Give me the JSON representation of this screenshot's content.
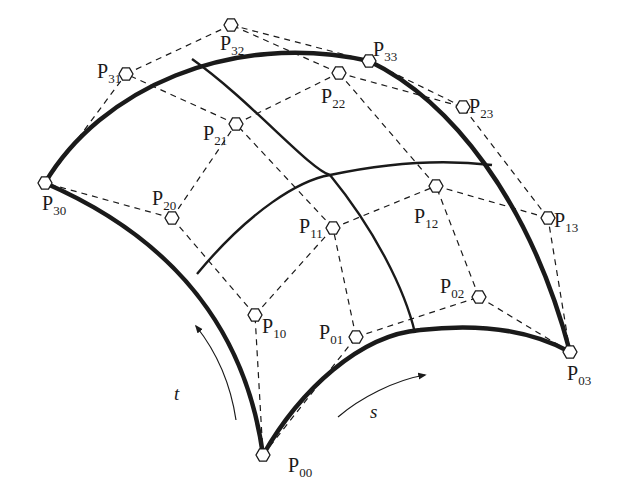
{
  "figure": {
    "colors": {
      "stroke": "#1a1a1a",
      "background": "#ffffff"
    },
    "control_points": [
      {
        "id": "P00",
        "letter": "P",
        "sub": "00",
        "x": 263,
        "y": 455,
        "lx": 288,
        "ly": 472,
        "anchor": "start"
      },
      {
        "id": "P01",
        "letter": "P",
        "sub": "01",
        "x": 356,
        "y": 337,
        "lx": 319,
        "ly": 339,
        "anchor": "start"
      },
      {
        "id": "P02",
        "letter": "P",
        "sub": "02",
        "x": 479,
        "y": 297,
        "lx": 440,
        "ly": 293,
        "anchor": "start"
      },
      {
        "id": "P03",
        "letter": "P",
        "sub": "03",
        "x": 570,
        "y": 352,
        "lx": 567,
        "ly": 380,
        "anchor": "start"
      },
      {
        "id": "P10",
        "letter": "P",
        "sub": "10",
        "x": 255,
        "y": 315,
        "lx": 262,
        "ly": 333,
        "anchor": "start"
      },
      {
        "id": "P11",
        "letter": "P",
        "sub": "11",
        "x": 333,
        "y": 228,
        "lx": 299,
        "ly": 233,
        "anchor": "start"
      },
      {
        "id": "P12",
        "letter": "P",
        "sub": "12",
        "x": 436,
        "y": 186,
        "lx": 414,
        "ly": 223,
        "anchor": "start"
      },
      {
        "id": "P13",
        "letter": "P",
        "sub": "13",
        "x": 548,
        "y": 218,
        "lx": 554,
        "ly": 227,
        "anchor": "start"
      },
      {
        "id": "P20",
        "letter": "P",
        "sub": "20",
        "x": 172,
        "y": 218,
        "lx": 152,
        "ly": 205,
        "anchor": "start"
      },
      {
        "id": "P21",
        "letter": "P",
        "sub": "21",
        "x": 236,
        "y": 124,
        "lx": 203,
        "ly": 140,
        "anchor": "start"
      },
      {
        "id": "P22",
        "letter": "P",
        "sub": "22",
        "x": 339,
        "y": 73,
        "lx": 321,
        "ly": 103,
        "anchor": "start"
      },
      {
        "id": "P23",
        "letter": "P",
        "sub": "23",
        "x": 463,
        "y": 107,
        "lx": 469,
        "ly": 113,
        "anchor": "start"
      },
      {
        "id": "P30",
        "letter": "P",
        "sub": "30",
        "x": 45,
        "y": 183,
        "lx": 42,
        "ly": 210,
        "anchor": "start"
      },
      {
        "id": "P31",
        "letter": "P",
        "sub": "31",
        "x": 126,
        "y": 74,
        "lx": 97,
        "ly": 78,
        "anchor": "start"
      },
      {
        "id": "P32",
        "letter": "P",
        "sub": "32",
        "x": 231,
        "y": 25,
        "lx": 220,
        "ly": 50,
        "anchor": "start"
      },
      {
        "id": "P33",
        "letter": "P",
        "sub": "33",
        "x": 369,
        "y": 61,
        "lx": 373,
        "ly": 56,
        "anchor": "start"
      }
    ],
    "control_net": [
      [
        "P00",
        "P01"
      ],
      [
        "P01",
        "P02"
      ],
      [
        "P02",
        "P03"
      ],
      [
        "P10",
        "P11"
      ],
      [
        "P11",
        "P12"
      ],
      [
        "P12",
        "P13"
      ],
      [
        "P20",
        "P21"
      ],
      [
        "P21",
        "P22"
      ],
      [
        "P22",
        "P23"
      ],
      [
        "P30",
        "P31"
      ],
      [
        "P31",
        "P32"
      ],
      [
        "P32",
        "P33"
      ],
      [
        "P00",
        "P10"
      ],
      [
        "P10",
        "P20"
      ],
      [
        "P20",
        "P30"
      ],
      [
        "P01",
        "P11"
      ],
      [
        "P11",
        "P21"
      ],
      [
        "P21",
        "P31"
      ],
      [
        "P02",
        "P12"
      ],
      [
        "P12",
        "P22"
      ],
      [
        "P22",
        "P32"
      ],
      [
        "P03",
        "P13"
      ],
      [
        "P13",
        "P23"
      ],
      [
        "P23",
        "P33"
      ]
    ],
    "boundary_curves": [
      {
        "name": "curve-t0-bottom",
        "d": "M263,455 C300,390 360,335 420,330 C480,323 530,330 570,352"
      },
      {
        "name": "curve-s0-left",
        "d": "M263,455 C250,360 200,250 45,183"
      },
      {
        "name": "curve-t1-top",
        "d": "M45,183 C100,90 230,30 369,61"
      },
      {
        "name": "curve-s1-right",
        "d": "M369,61 C450,100 530,200 570,352"
      }
    ],
    "iso_curves": [
      {
        "name": "iso-s-mid-1",
        "d": "M192,59 C250,100 310,170 330,175"
      },
      {
        "name": "iso-s-mid-1b",
        "d": "M330,175 C375,230 405,290 415,333"
      },
      {
        "name": "iso-t-mid-1",
        "d": "M197,274 C250,210 300,180 330,175 C400,160 450,160 492,165"
      }
    ],
    "parameter_labels": {
      "t": "t",
      "s": "s"
    },
    "parameter_arrows": {
      "t_arrow": "M236,420 C230,380 215,350 196,326",
      "s_arrow": "M338,417 C360,398 395,380 425,375"
    }
  }
}
